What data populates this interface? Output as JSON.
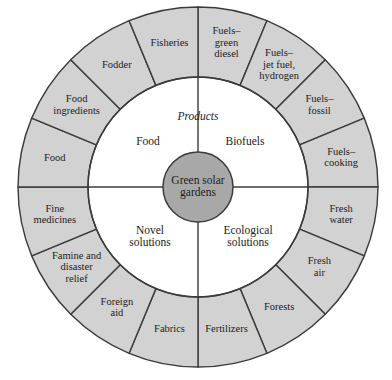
{
  "figure": {
    "type": "concentric-ring-diagram",
    "background_color": "#ffffff",
    "outer_ring_fill": "#d2d2d2",
    "inner_ring_fill": "#ffffff",
    "core_fill": "#a8a8a8",
    "stroke_color": "#3b3b3b"
  },
  "geometry": {
    "center_x": 198,
    "center_y": 187,
    "core_radius": 35,
    "inner_ring_radius": 110,
    "outer_ring_radius": 180
  },
  "core": {
    "label": "Green solar gardens",
    "line1": "Green solar",
    "line2": "gardens"
  },
  "header": {
    "products_label": "Products"
  },
  "inner_ring": {
    "quadrants": [
      {
        "id": "food",
        "label": "Food",
        "line1": "Food",
        "line2": "",
        "cx": 148,
        "cy": 142
      },
      {
        "id": "biofuels",
        "label": "Biofuels",
        "line1": "Biofuels",
        "line2": "",
        "cx": 245,
        "cy": 142
      },
      {
        "id": "novel-solutions",
        "label": "Novel solutions",
        "line1": "Novel",
        "line2": "solutions",
        "cx": 150,
        "cy": 237
      },
      {
        "id": "ecological-solutions",
        "label": "Ecological solutions",
        "line1": "Ecological",
        "line2": "solutions",
        "cx": 248,
        "cy": 237
      }
    ]
  },
  "outer_ring": {
    "sector_count": 16,
    "sectors": [
      {
        "id": "fuels-green-diesel",
        "label": "Fuels–green diesel",
        "lines": [
          "Fuels–",
          "green",
          "diesel"
        ],
        "start_deg": -90,
        "end_deg": -67.5,
        "label_radius": 146
      },
      {
        "id": "fuels-jet-fuel-hydrogen",
        "label": "Fuels–jet fuel, hydrogen",
        "lines": [
          "Fuels–",
          "jet fuel,",
          "hydrogen"
        ],
        "start_deg": -67.5,
        "end_deg": -45,
        "label_radius": 146
      },
      {
        "id": "fuels-fossil",
        "label": "Fuels–fossil",
        "lines": [
          "Fuels–",
          "fossil"
        ],
        "start_deg": -45,
        "end_deg": -22.5,
        "label_radius": 146
      },
      {
        "id": "fuels-cooking",
        "label": "Fuels–cooking",
        "lines": [
          "Fuels–",
          "cooking"
        ],
        "start_deg": -22.5,
        "end_deg": 0,
        "label_radius": 146
      },
      {
        "id": "fresh-water",
        "label": "Fresh water",
        "lines": [
          "Fresh",
          "water"
        ],
        "start_deg": 0,
        "end_deg": 22.5,
        "label_radius": 146
      },
      {
        "id": "fresh-air",
        "label": "Fresh air",
        "lines": [
          "Fresh",
          "air"
        ],
        "start_deg": 22.5,
        "end_deg": 45,
        "label_radius": 146
      },
      {
        "id": "forests",
        "label": "Forests",
        "lines": [
          "Forests"
        ],
        "start_deg": 45,
        "end_deg": 67.5,
        "label_radius": 146
      },
      {
        "id": "fertilizers",
        "label": "Fertilizers",
        "lines": [
          "Fertilizers"
        ],
        "start_deg": 67.5,
        "end_deg": 90,
        "label_radius": 146
      },
      {
        "id": "fabrics",
        "label": "Fabrics",
        "lines": [
          "Fabrics"
        ],
        "start_deg": 90,
        "end_deg": 112.5,
        "label_radius": 146
      },
      {
        "id": "foreign-aid",
        "label": "Foreign aid",
        "lines": [
          "Foreign",
          "aid"
        ],
        "start_deg": 112.5,
        "end_deg": 135,
        "label_radius": 146
      },
      {
        "id": "famine-and-disaster-relief",
        "label": "Famine and disaster relief",
        "lines": [
          "Famine and",
          "disaster",
          "relief"
        ],
        "start_deg": 135,
        "end_deg": 157.5,
        "label_radius": 146
      },
      {
        "id": "fine-medicines",
        "label": "Fine medicines",
        "lines": [
          "Fine",
          "medicines"
        ],
        "start_deg": 157.5,
        "end_deg": 180,
        "label_radius": 146
      },
      {
        "id": "food",
        "label": "Food",
        "lines": [
          "Food"
        ],
        "start_deg": 180,
        "end_deg": 202.5,
        "label_radius": 146
      },
      {
        "id": "food-ingredients",
        "label": "Food ingredients",
        "lines": [
          "Food",
          "ingredients"
        ],
        "start_deg": 202.5,
        "end_deg": 225,
        "label_radius": 146
      },
      {
        "id": "fodder",
        "label": "Fodder",
        "lines": [
          "Fodder"
        ],
        "start_deg": 225,
        "end_deg": 247.5,
        "label_radius": 146
      },
      {
        "id": "fisheries",
        "label": "Fisheries",
        "lines": [
          "Fisheries"
        ],
        "start_deg": 247.5,
        "end_deg": 270,
        "label_radius": 146
      }
    ]
  }
}
